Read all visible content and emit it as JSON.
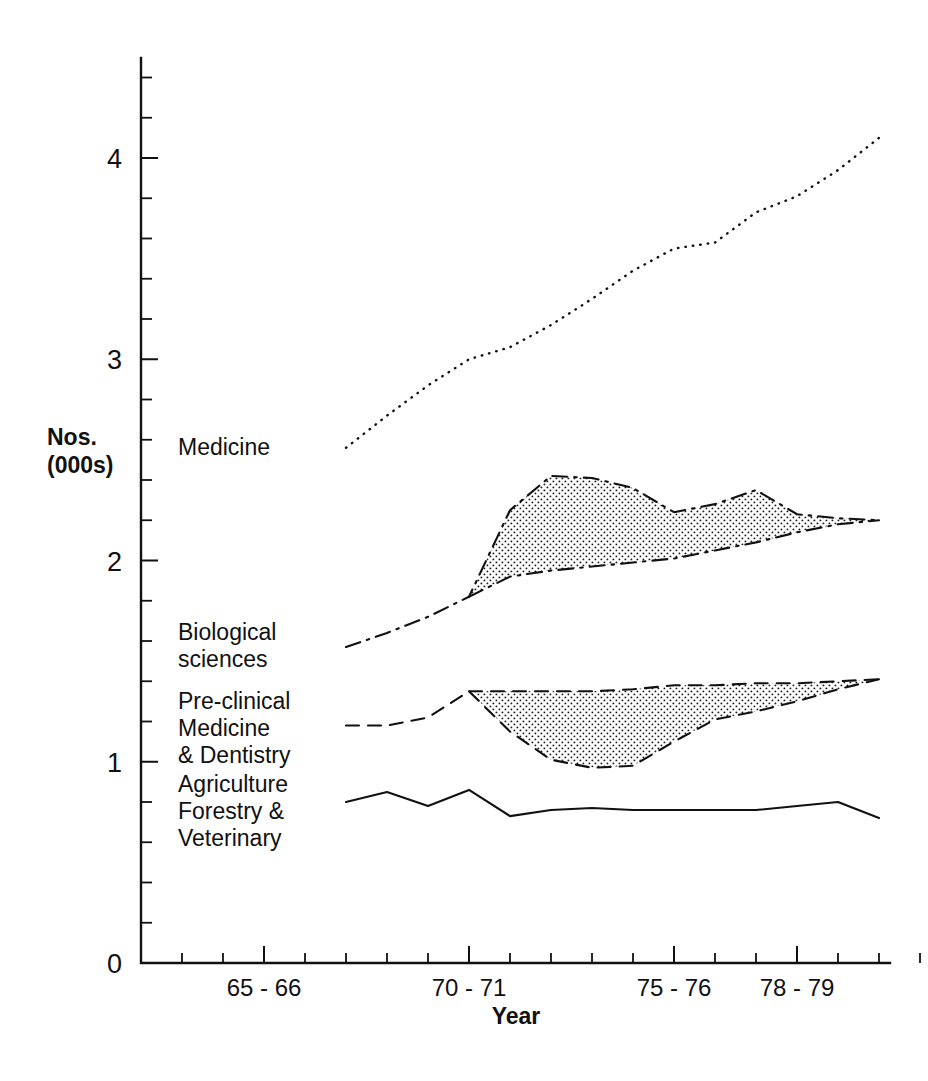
{
  "figure": {
    "y_axis_title_line1": "Nos.",
    "y_axis_title_line2": "(000s)",
    "x_axis_title": "Year"
  },
  "chart_data": {
    "type": "line",
    "title": "",
    "xlabel": "Year",
    "ylabel": "Nos. (000s)",
    "ylim": [
      0,
      4.5
    ],
    "yticks": [
      0,
      1,
      2,
      3,
      4
    ],
    "ytick_labels": [
      "0",
      "1",
      "2",
      "3",
      "4"
    ],
    "y_minor_tick_step": 0.2,
    "xlim": [
      "63-64",
      "81-82"
    ],
    "x_categories": [
      "63-64",
      "64-65",
      "65-66",
      "66-67",
      "67-68",
      "68-69",
      "69-70",
      "70-71",
      "71-72",
      "72-73",
      "73-74",
      "74-75",
      "75-76",
      "76-77",
      "77-78",
      "78-79",
      "79-80",
      "80-81",
      "81-82"
    ],
    "xtick_labels": [
      "65 - 66",
      "70 - 71",
      "75 - 76",
      "78 - 79"
    ],
    "xtick_label_categories": [
      "65-66",
      "70-71",
      "75-76",
      "78-79"
    ],
    "grid": false,
    "legend_position": "inline-left-labels",
    "series": [
      {
        "name": "Medicine",
        "label": "Medicine",
        "line_style": "dotted",
        "x_start": "67-68",
        "categories": [
          "67-68",
          "68-69",
          "69-70",
          "70-71",
          "71-72",
          "72-73",
          "73-74",
          "74-75",
          "75-76",
          "76-77",
          "77-78",
          "78-79",
          "79-80",
          "80-81"
        ],
        "values": [
          2.56,
          2.72,
          2.87,
          3.0,
          3.06,
          3.17,
          3.3,
          3.44,
          3.55,
          3.58,
          3.73,
          3.81,
          3.94,
          4.1
        ]
      },
      {
        "name": "Biological sciences",
        "label": "Biological\nsciences",
        "label_line1": "Biological",
        "label_line2": "sciences",
        "line_style": "dash-dot",
        "x_start": "67-68",
        "categories": [
          "67-68",
          "68-69",
          "69-70",
          "70-71",
          "71-72",
          "72-73",
          "73-74",
          "74-75",
          "75-76",
          "76-77",
          "77-78",
          "78-79",
          "79-80",
          "80-81"
        ],
        "values": [
          1.57,
          1.64,
          1.72,
          1.82,
          2.25,
          2.42,
          2.41,
          2.36,
          2.24,
          2.28,
          2.35,
          2.23,
          2.21,
          2.2
        ]
      },
      {
        "name": "Pre-clinical Medicine & Dentistry",
        "label_line1": "Pre-clinical",
        "label_line2": "Medicine",
        "label_line3": "& Dentistry",
        "line_style": "dashed",
        "x_start": "67-68",
        "categories": [
          "67-68",
          "68-69",
          "69-70",
          "70-71",
          "71-72",
          "72-73",
          "73-74",
          "74-75",
          "75-76",
          "76-77",
          "77-78",
          "78-79",
          "79-80",
          "80-81"
        ],
        "values": [
          1.18,
          1.18,
          1.22,
          1.35,
          1.15,
          1.01,
          0.97,
          0.98,
          1.1,
          1.21,
          1.25,
          1.3,
          1.36,
          1.41
        ]
      },
      {
        "name": "Agriculture Forestry & Veterinary",
        "label_line1": "Agriculture",
        "label_line2": "Forestry &",
        "label_line3": "Veterinary",
        "line_style": "solid",
        "x_start": "67-68",
        "categories": [
          "67-68",
          "68-69",
          "69-70",
          "70-71",
          "71-72",
          "72-73",
          "73-74",
          "74-75",
          "75-76",
          "76-77",
          "77-78",
          "78-79",
          "79-80",
          "80-81"
        ],
        "values": [
          0.8,
          0.85,
          0.78,
          0.86,
          0.73,
          0.76,
          0.77,
          0.76,
          0.76,
          0.76,
          0.76,
          0.78,
          0.8,
          0.72
        ]
      }
    ],
    "shaded_regions": [
      {
        "name": "biological-sciences-shaded-gap",
        "between_series": "Biological sciences",
        "fill": "stipple",
        "categories": [
          "70-71",
          "71-72",
          "72-73",
          "73-74",
          "74-75",
          "75-76",
          "76-77",
          "77-78",
          "78-79",
          "79-80",
          "80-81"
        ],
        "upper_values": [
          1.82,
          2.25,
          2.42,
          2.41,
          2.36,
          2.24,
          2.28,
          2.35,
          2.23,
          2.21,
          2.2
        ],
        "lower_values": [
          1.82,
          1.92,
          1.95,
          1.97,
          1.99,
          2.01,
          2.05,
          2.09,
          2.14,
          2.18,
          2.2
        ]
      },
      {
        "name": "pre-clinical-shaded-gap",
        "between_series": "Pre-clinical Medicine & Dentistry",
        "fill": "stipple",
        "categories": [
          "70-71",
          "71-72",
          "72-73",
          "73-74",
          "74-75",
          "75-76",
          "76-77",
          "77-78",
          "78-79",
          "79-80",
          "80-81"
        ],
        "upper_values": [
          1.35,
          1.35,
          1.35,
          1.35,
          1.36,
          1.38,
          1.38,
          1.39,
          1.39,
          1.4,
          1.41
        ],
        "lower_values": [
          1.35,
          1.15,
          1.01,
          0.97,
          0.98,
          1.1,
          1.21,
          1.25,
          1.3,
          1.36,
          1.41
        ]
      }
    ]
  },
  "colors": {
    "ink": "#111111",
    "background": "#ffffff"
  }
}
